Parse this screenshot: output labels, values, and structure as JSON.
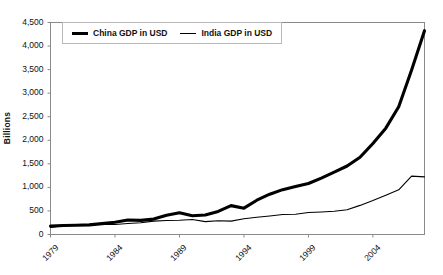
{
  "chart_data": {
    "type": "line",
    "title": "",
    "xlabel": "",
    "ylabel": "Billions",
    "ylim": [
      0,
      4500
    ],
    "xlim": [
      1979,
      2008
    ],
    "ytick_labels": [
      "4,500",
      "4,000",
      "3,500",
      "3,000",
      "2,500",
      "2,000",
      "1,500",
      "1,000",
      "500",
      "0"
    ],
    "ytick_values": [
      4500,
      4000,
      3500,
      3000,
      2500,
      2000,
      1500,
      1000,
      500,
      0
    ],
    "xtick_labels": [
      "1979",
      "1984",
      "1989",
      "1994",
      "1999",
      "2004"
    ],
    "xtick_values": [
      1979,
      1984,
      1989,
      1994,
      1999,
      2004
    ],
    "grid": false,
    "legend_position": "top-left-inside",
    "x": [
      1979,
      1980,
      1981,
      1982,
      1983,
      1984,
      1985,
      1986,
      1987,
      1988,
      1989,
      1990,
      1991,
      1992,
      1993,
      1994,
      1995,
      1996,
      1997,
      1998,
      1999,
      2000,
      2001,
      2002,
      2003,
      2004,
      2005,
      2006,
      2007,
      2008
    ],
    "series": [
      {
        "name": "China GDP in USD",
        "style": "thick",
        "color": "#000000",
        "values": [
          178,
          191,
          195,
          205,
          230,
          259,
          307,
          300,
          327,
          409,
          461,
          398,
          413,
          489,
          613,
          559,
          728,
          856,
          952,
          1019,
          1083,
          1198,
          1325,
          1454,
          1641,
          1932,
          2257,
          2713,
          3494,
          4327
        ]
      },
      {
        "name": "India GDP in USD",
        "style": "thin",
        "color": "#000000",
        "values": [
          152,
          187,
          194,
          201,
          218,
          212,
          232,
          251,
          283,
          297,
          301,
          317,
          274,
          293,
          284,
          333,
          366,
          393,
          423,
          429,
          466,
          477,
          494,
          524,
          618,
          721,
          834,
          949,
          1239,
          1224
        ]
      }
    ]
  },
  "legend": {
    "entries": [
      {
        "label": "China GDP in USD"
      },
      {
        "label": "India GDP in USD"
      }
    ]
  },
  "axes": {
    "y_title": "Billions"
  }
}
